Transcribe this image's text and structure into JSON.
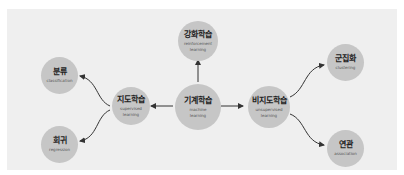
{
  "diagram": {
    "title": "",
    "nodes": [
      {
        "id": "ml",
        "ko": "기계학습",
        "en": "machine\nlearning"
      },
      {
        "id": "rl",
        "ko": "강화학습",
        "en": "reinforcement\nlearning"
      },
      {
        "id": "sl",
        "ko": "지도학습",
        "en": "supervised\nlearning"
      },
      {
        "id": "ul",
        "ko": "비지도학습",
        "en": "unsupervised\nlearning"
      },
      {
        "id": "cls",
        "ko": "분류",
        "en": "classification"
      },
      {
        "id": "reg",
        "ko": "회귀",
        "en": "regression"
      },
      {
        "id": "clu",
        "ko": "군집화",
        "en": "clustering"
      },
      {
        "id": "asc",
        "ko": "연관",
        "en": "association"
      }
    ],
    "edges": [
      {
        "from": "ml",
        "to": "rl"
      },
      {
        "from": "ml",
        "to": "sl"
      },
      {
        "from": "ml",
        "to": "ul"
      },
      {
        "from": "sl",
        "to": "cls"
      },
      {
        "from": "sl",
        "to": "reg"
      },
      {
        "from": "ul",
        "to": "clu"
      },
      {
        "from": "ul",
        "to": "asc"
      }
    ],
    "colors": {
      "background": "#efefef",
      "node": "#c6c6c6",
      "edge": "#333333"
    }
  }
}
